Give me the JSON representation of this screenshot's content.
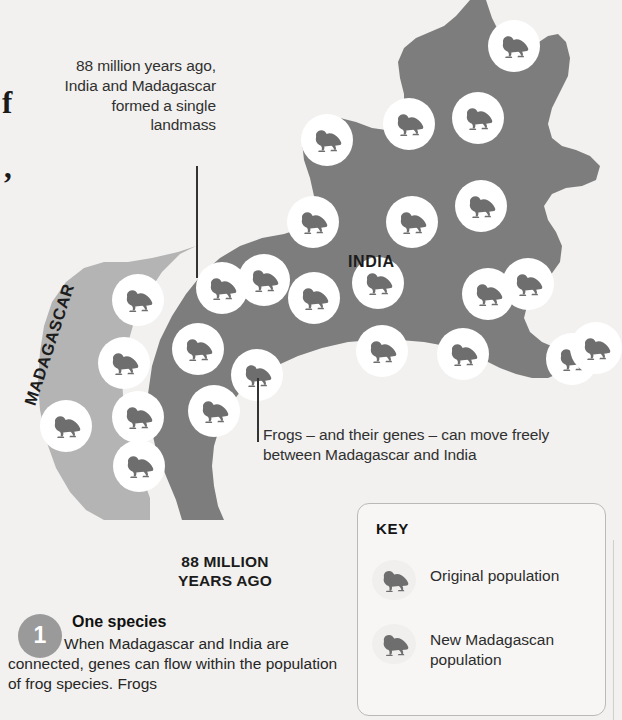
{
  "map": {
    "labels": {
      "india": "INDIA",
      "madagascar": "MADAGASCAR"
    },
    "colors": {
      "india_fill": "#7d7d7d",
      "madagascar_fill": "#b4b4b4",
      "background": "#f2f1ef",
      "marker_circle": "#ffffff",
      "frog_silhouette": "#6e6e6e",
      "badge": "#9a9a9a"
    },
    "marker_count_total": 25,
    "markers": [
      {
        "x": 488,
        "y": 20,
        "region": "india"
      },
      {
        "x": 383,
        "y": 98,
        "region": "india"
      },
      {
        "x": 452,
        "y": 92,
        "region": "india"
      },
      {
        "x": 301,
        "y": 114,
        "region": "india"
      },
      {
        "x": 455,
        "y": 180,
        "region": "india"
      },
      {
        "x": 386,
        "y": 196,
        "region": "india"
      },
      {
        "x": 305,
        "y": 200,
        "region": "india"
      },
      {
        "x": 462,
        "y": 268,
        "region": "india"
      },
      {
        "x": 352,
        "y": 257,
        "region": "india"
      },
      {
        "x": 238,
        "y": 254,
        "region": "madagascar"
      },
      {
        "x": 112,
        "y": 274,
        "region": "madagascar"
      },
      {
        "x": 196,
        "y": 260,
        "region": "india"
      },
      {
        "x": 288,
        "y": 272,
        "region": "india"
      },
      {
        "x": 546,
        "y": 333,
        "region": "india"
      },
      {
        "x": 437,
        "y": 328,
        "region": "india"
      },
      {
        "x": 356,
        "y": 325,
        "region": "india"
      },
      {
        "x": 172,
        "y": 323,
        "region": "madagascar"
      },
      {
        "x": 98,
        "y": 337,
        "region": "madagascar"
      },
      {
        "x": 570,
        "y": 322,
        "region": "india"
      },
      {
        "x": 247,
        "y": 347,
        "region": "india"
      },
      {
        "x": 40,
        "y": 400,
        "region": "madagascar"
      },
      {
        "x": 120,
        "y": 391,
        "region": "madagascar"
      },
      {
        "x": 196,
        "y": 385,
        "region": "india"
      },
      {
        "x": 118,
        "y": 432,
        "region": "madagascar"
      },
      {
        "x": 285,
        "y": 196,
        "region": "india"
      }
    ]
  },
  "annotations": {
    "landmass": "88 million years ago, India and Madagascar formed a single landmass",
    "gene_flow": "Frogs – and their genes – can move freely between Madagascar and India"
  },
  "era": {
    "line1": "88 MILLION",
    "line2": "YEARS AGO"
  },
  "step": {
    "number": "1",
    "title": "One species",
    "body": "When Madagascar and India are connected, genes can flow within the population of frog species. Frogs"
  },
  "key": {
    "title": "KEY",
    "items": [
      {
        "icon": "frog-icon",
        "label": "Original population"
      },
      {
        "icon": "frog-icon",
        "label": "New Madagascan population"
      }
    ]
  },
  "edge_fragments": {
    "letter": "f",
    "comma": ","
  }
}
